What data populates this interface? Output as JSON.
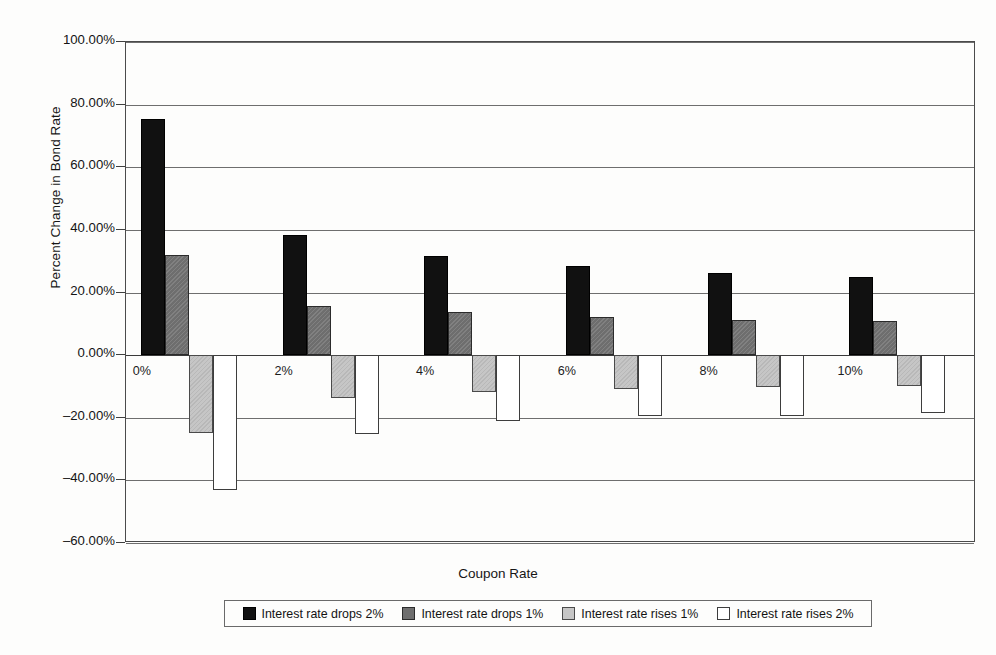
{
  "chart_data": {
    "type": "bar",
    "title": "",
    "xlabel": "Coupon Rate",
    "ylabel": "Percent Change in Bond Rate",
    "categories": [
      "0%",
      "2%",
      "4%",
      "6%",
      "8%",
      "10%"
    ],
    "series": [
      {
        "name": "Interest rate drops 2%",
        "color": "#111111",
        "values": [
          75.5,
          38.5,
          31.8,
          28.4,
          26.3,
          24.9
        ]
      },
      {
        "name": "Interest rate drops 1%",
        "color": "#6e6e6e",
        "values": [
          32.0,
          15.8,
          13.8,
          12.3,
          11.3,
          10.9
        ]
      },
      {
        "name": "Interest rate rises 1%",
        "color": "#c6c6c6",
        "values": [
          -25.0,
          -13.6,
          -11.9,
          -10.8,
          -10.1,
          -10.0
        ]
      },
      {
        "name": "Interest rate rises 2%",
        "color": "#ffffff",
        "values": [
          -43.2,
          -25.2,
          -21.0,
          -19.6,
          -19.3,
          -18.6
        ]
      }
    ],
    "ylim": [
      -60,
      100
    ],
    "ytick_labels": [
      "100.00%",
      "80.00%",
      "60.00%",
      "40.00%",
      "20.00%",
      "0.00%",
      "–20.00%",
      "–40.00%",
      "–60.00%"
    ],
    "ytick_values": [
      100,
      80,
      60,
      40,
      20,
      0,
      -20,
      -40,
      -60
    ],
    "grid": true,
    "legend_position": "bottom"
  }
}
